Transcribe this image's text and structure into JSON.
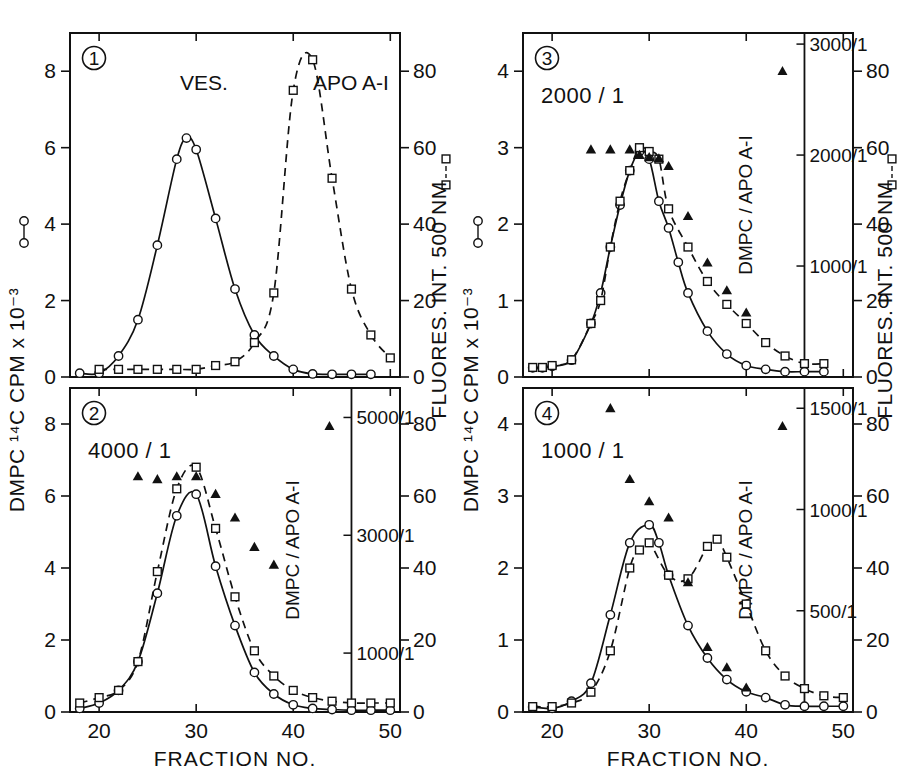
{
  "figure": {
    "xlabel": "FRACTION  NO.",
    "left_axis_label": "DMPC  ¹⁴C  CPM  x  10⁻³",
    "right_axis_label": "FLUORES.  INT.  500 NM",
    "inset_axis_label": "DMPC / APO A-I",
    "x_ticks": [
      20,
      30,
      40,
      50
    ],
    "xlim": [
      17,
      51
    ],
    "right_ticks": [
      0,
      20,
      40,
      60,
      80
    ],
    "right_lim": [
      0,
      90
    ],
    "series_legend": {
      "circle": "DMPC ¹⁴C CPM x 10⁻³",
      "square": "FLUORES. INT. 500 NM",
      "triangle": "DMPC / APO A-I"
    }
  },
  "chart_data": [
    {
      "panel": "1",
      "panel_number": "1",
      "type": "line",
      "title": "",
      "annotations": [
        "VES.",
        "APO A-I"
      ],
      "ratio_label": "",
      "xlabel": "FRACTION  NO.",
      "ylabel": "DMPC  ¹⁴C  CPM  x  10⁻³",
      "y2label": "FLUORES.  INT.  500 NM",
      "xlim": [
        17,
        51
      ],
      "ylim": [
        0,
        9
      ],
      "y_ticks": [
        0,
        2,
        4,
        6,
        8
      ],
      "y2lim": [
        0,
        90
      ],
      "y2_ticks": [
        0,
        20,
        40,
        60,
        80
      ],
      "grid": false,
      "has_inset_axis": false,
      "series": [
        {
          "name": "DMPC 14C CPM",
          "marker": "circle",
          "line": "solid",
          "axis": "left",
          "x": [
            18,
            20,
            22,
            24,
            26,
            28,
            29,
            30,
            32,
            34,
            36,
            38,
            40,
            42,
            44,
            46,
            48
          ],
          "y": [
            0.1,
            0.1,
            0.55,
            1.5,
            3.45,
            5.7,
            6.25,
            5.95,
            4.15,
            2.3,
            1.1,
            0.55,
            0.2,
            0.08,
            0.07,
            0.07,
            0.07
          ]
        },
        {
          "name": "FLUORES. INT. 500 NM",
          "marker": "square",
          "line": "dashed",
          "axis": "right",
          "x": [
            20,
            22,
            24,
            26,
            28,
            30,
            32,
            34,
            36,
            38,
            40,
            42,
            44,
            46,
            48,
            50
          ],
          "y": [
            2,
            2,
            2,
            2,
            2,
            2,
            3,
            4,
            9,
            22,
            75,
            83,
            52,
            23,
            11,
            5
          ]
        }
      ]
    },
    {
      "panel": "2",
      "panel_number": "2",
      "type": "line",
      "ratio_label": "4000 / 1",
      "annotations": [],
      "xlabel": "FRACTION  NO.",
      "ylabel": "DMPC  ¹⁴C  CPM  x  10⁻³",
      "y2label": "FLUORES.  INT.  500 NM",
      "xlim": [
        17,
        51
      ],
      "ylim": [
        0,
        9
      ],
      "y_ticks": [
        0,
        2,
        4,
        6,
        8
      ],
      "y2lim": [
        0,
        90
      ],
      "y2_ticks": [
        0,
        20,
        40,
        60,
        80
      ],
      "grid": false,
      "has_inset_axis": true,
      "inset_axis": {
        "label": "DMPC / APO A-I",
        "ticks": [
          "1000/1",
          "3000/1",
          "5000/1"
        ],
        "tick_values": [
          1000,
          3000,
          5000
        ],
        "lim": [
          0,
          5500
        ],
        "x_position": 46
      },
      "series": [
        {
          "name": "DMPC 14C CPM",
          "marker": "circle",
          "line": "solid",
          "axis": "left",
          "x": [
            18,
            20,
            22,
            24,
            26,
            28,
            30,
            32,
            34,
            36,
            38,
            40,
            42,
            44,
            46,
            48,
            50
          ],
          "y": [
            0.1,
            0.25,
            0.6,
            1.4,
            3.3,
            5.45,
            6.05,
            4.05,
            2.4,
            1.1,
            0.5,
            0.2,
            0.1,
            0.07,
            0.05,
            0.05,
            0.05
          ]
        },
        {
          "name": "FLUORES. INT. 500 NM",
          "marker": "square",
          "line": "dashed",
          "axis": "right",
          "x": [
            18,
            20,
            22,
            24,
            26,
            28,
            30,
            32,
            34,
            36,
            38,
            40,
            42,
            44,
            46,
            48,
            50
          ],
          "y": [
            2.5,
            4,
            6,
            14,
            39,
            62,
            68,
            51,
            32,
            17,
            10,
            6,
            4,
            3,
            2.5,
            2.5,
            2.5
          ]
        },
        {
          "name": "DMPC / APO A-I",
          "marker": "triangle",
          "line": "none",
          "axis": "inset",
          "x": [
            24,
            26,
            28,
            30,
            32,
            34,
            36,
            38
          ],
          "y": [
            4000,
            3950,
            4000,
            4000,
            3700,
            3300,
            2800,
            2500
          ]
        }
      ]
    },
    {
      "panel": "3",
      "panel_number": "3",
      "type": "line",
      "ratio_label": "2000 / 1",
      "annotations": [],
      "xlabel": "FRACTION  NO.",
      "ylabel": "DMPC  ¹⁴C  CPM  x  10⁻³",
      "y2label": "FLUORES.  INT.  500 NM",
      "xlim": [
        17,
        51
      ],
      "ylim": [
        0,
        4.5
      ],
      "y_ticks": [
        0,
        1,
        2,
        3,
        4
      ],
      "y2lim": [
        0,
        90
      ],
      "y2_ticks": [
        0,
        20,
        40,
        60,
        80
      ],
      "grid": false,
      "has_inset_axis": true,
      "inset_axis": {
        "label": "DMPC / APO A-I",
        "ticks": [
          "1000/1",
          "2000/1",
          "3000/1"
        ],
        "tick_values": [
          1000,
          2000,
          3000
        ],
        "lim": [
          0,
          3100
        ],
        "x_position": 46
      },
      "series": [
        {
          "name": "DMPC 14C CPM",
          "marker": "circle",
          "line": "solid",
          "axis": "left",
          "x": [
            18,
            19,
            20,
            22,
            24,
            25,
            26,
            27,
            28,
            29,
            30,
            31,
            32,
            33,
            34,
            36,
            38,
            40,
            42,
            44,
            46,
            48
          ],
          "y": [
            0.12,
            0.12,
            0.14,
            0.22,
            0.7,
            1.1,
            1.7,
            2.25,
            2.7,
            2.95,
            2.85,
            2.3,
            1.95,
            1.5,
            1.1,
            0.6,
            0.3,
            0.15,
            0.1,
            0.07,
            0.07,
            0.07
          ]
        },
        {
          "name": "FLUORES. INT. 500 NM",
          "marker": "square",
          "line": "dashed",
          "axis": "right",
          "x": [
            18,
            19,
            20,
            22,
            24,
            25,
            26,
            27,
            28,
            29,
            30,
            31,
            32,
            34,
            36,
            38,
            40,
            42,
            44,
            46,
            48
          ],
          "y": [
            2.5,
            2.5,
            3,
            4.5,
            14,
            20,
            34,
            46,
            54,
            60,
            59,
            57,
            44,
            34,
            25,
            19,
            14,
            9,
            5.5,
            3.5,
            3.5
          ]
        },
        {
          "name": "DMPC / APO A-I",
          "marker": "triangle",
          "line": "none",
          "axis": "inset",
          "x": [
            24,
            26,
            28,
            29,
            30,
            31,
            32,
            34,
            36,
            38,
            40
          ],
          "y": [
            2050,
            2050,
            2050,
            2000,
            1980,
            1970,
            1900,
            1450,
            1030,
            780,
            580
          ]
        }
      ]
    },
    {
      "panel": "4",
      "panel_number": "4",
      "type": "line",
      "ratio_label": "1000 / 1",
      "annotations": [],
      "xlabel": "FRACTION  NO.",
      "ylabel": "DMPC  ¹⁴C  CPM  x  10⁻³",
      "y2label": "FLUORES.  INT.  500 NM",
      "xlim": [
        17,
        51
      ],
      "ylim": [
        0,
        4.5
      ],
      "y_ticks": [
        0,
        1,
        2,
        3,
        4
      ],
      "y2lim": [
        0,
        90
      ],
      "y2_ticks": [
        0,
        20,
        40,
        60,
        80
      ],
      "grid": false,
      "has_inset_axis": true,
      "inset_axis": {
        "label": "DMPC / APO A-I",
        "ticks": [
          "500/1",
          "1000/1",
          "1500/1"
        ],
        "tick_values": [
          500,
          1000,
          1500
        ],
        "lim": [
          0,
          1600
        ],
        "x_position": 46
      },
      "series": [
        {
          "name": "DMPC 14C CPM",
          "marker": "circle",
          "line": "solid",
          "axis": "left",
          "x": [
            18,
            20,
            22,
            24,
            26,
            28,
            30,
            31,
            32,
            34,
            36,
            38,
            40,
            42,
            44,
            46,
            48,
            50
          ],
          "y": [
            0.07,
            0.05,
            0.15,
            0.4,
            1.35,
            2.35,
            2.6,
            2.35,
            1.9,
            1.2,
            0.75,
            0.45,
            0.28,
            0.2,
            0.1,
            0.08,
            0.08,
            0.08
          ]
        },
        {
          "name": "FLUORES. INT. 500 NM",
          "marker": "square",
          "line": "dashed",
          "axis": "right",
          "x": [
            18,
            20,
            22,
            24,
            26,
            28,
            29,
            30,
            32,
            34,
            36,
            37,
            38,
            40,
            42,
            44,
            46,
            48,
            50
          ],
          "y": [
            1.5,
            1.5,
            2.5,
            5.5,
            17,
            40,
            45,
            47,
            38,
            37,
            46,
            48,
            43,
            30,
            17,
            10,
            6.5,
            4.5,
            4
          ]
        },
        {
          "name": "DMPC / APO A-I",
          "marker": "triangle",
          "line": "none",
          "axis": "inset",
          "x": [
            26,
            28,
            30,
            32,
            34,
            36,
            38,
            40
          ],
          "y": [
            1500,
            1150,
            1040,
            960,
            640,
            320,
            220,
            120
          ]
        }
      ]
    }
  ]
}
